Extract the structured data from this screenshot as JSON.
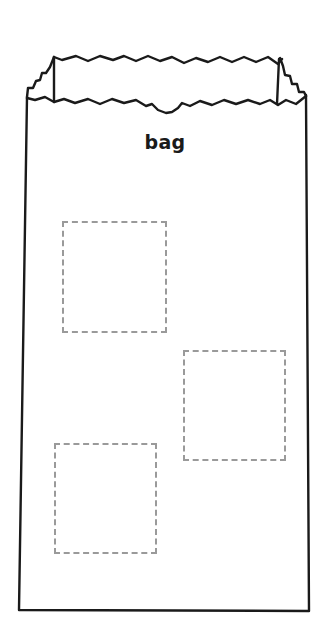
{
  "worksheet": {
    "title": "bag",
    "colors": {
      "outline": "#1a1a1a",
      "dashed_box": "#9a9a9a",
      "background": "#ffffff"
    },
    "boxes": [
      {
        "label": "box-1",
        "x": 62,
        "y": 221,
        "w": 105,
        "h": 112
      },
      {
        "label": "box-2",
        "x": 183,
        "y": 350,
        "w": 103,
        "h": 111
      },
      {
        "label": "box-3",
        "x": 54,
        "y": 443,
        "w": 103,
        "h": 111
      }
    ]
  }
}
